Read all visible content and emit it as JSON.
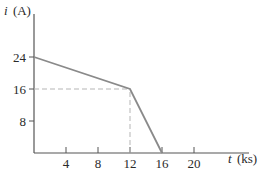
{
  "chart_data": {
    "type": "line",
    "title": "",
    "xlabel_var": "t",
    "xlabel_unit": "(ks)",
    "ylabel_var": "i",
    "ylabel_unit": "(A)",
    "x": [
      0,
      12,
      16
    ],
    "y": [
      24,
      16,
      0
    ],
    "series": [
      {
        "name": "i(t)",
        "x": [
          0,
          12,
          16
        ],
        "values": [
          24,
          16,
          0
        ]
      }
    ],
    "xticks": [
      "4",
      "8",
      "12",
      "16",
      "20"
    ],
    "yticks": [
      "8",
      "16",
      "24"
    ],
    "xlim": [
      0,
      26
    ],
    "ylim": [
      0,
      30
    ],
    "grid": false,
    "legend": "none",
    "annotations": [
      {
        "type": "dashed-guide",
        "from": [
          0,
          16
        ],
        "to": [
          12,
          16
        ]
      },
      {
        "type": "dashed-guide",
        "from": [
          12,
          0
        ],
        "to": [
          12,
          16
        ]
      }
    ]
  },
  "colors": {
    "axis": "#555555",
    "line": "#8a8a8a",
    "guide": "#b5b5b5",
    "text": "#2a2a2a"
  }
}
